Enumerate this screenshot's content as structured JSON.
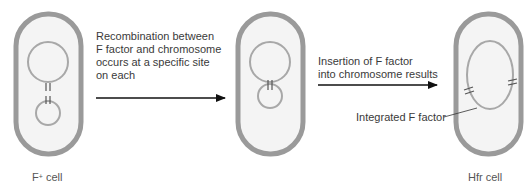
{
  "diagram": {
    "colors": {
      "cell_wall": "#9a9a9a",
      "cell_fill": "#f4f4f4",
      "dna_line": "#a8a8a8",
      "arrow": "#111111",
      "text": "#3a3a3a"
    },
    "cells": [
      {
        "id": "f-plus",
        "label_main": "F",
        "label_sup": "+",
        "label_rest": " cell"
      },
      {
        "id": "intermediate",
        "label": ""
      },
      {
        "id": "hfr",
        "label": "Hfr cell"
      }
    ],
    "steps": [
      {
        "lines": [
          "Recombination between",
          "F factor and chromosome",
          "occurs at a specific site",
          "on each"
        ]
      },
      {
        "lines": [
          "Insertion of F factor",
          "into chromosome results"
        ]
      }
    ],
    "callouts": [
      {
        "label": "Integrated F factor"
      }
    ]
  }
}
